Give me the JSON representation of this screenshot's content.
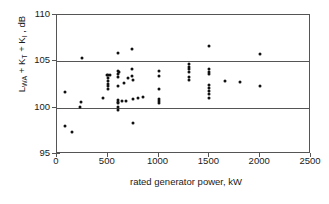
{
  "chart_data": {
    "type": "scatter",
    "title": "",
    "xlabel": "rated generator power, kW",
    "ylabel": "L_WA + K_T + K_I , dB",
    "ylabel_parts": {
      "base1": "L",
      "sub1": "WA",
      "plus1": " + ",
      "base2": "K",
      "sub2": "T",
      "plus2": " + ",
      "base3": "K",
      "sub3": "I",
      "tail": " , dB"
    },
    "xlim": [
      0,
      2500
    ],
    "ylim": [
      95,
      110
    ],
    "xticks": [
      0,
      500,
      1000,
      1500,
      2000,
      2500
    ],
    "yticks": [
      95,
      100,
      105,
      110
    ],
    "xtick_labels": [
      "0",
      "500",
      "1000",
      "1500",
      "2000",
      "2500"
    ],
    "ytick_labels": [
      "95",
      "100",
      "105",
      "110"
    ],
    "gridlines_y": [
      100,
      105
    ],
    "grid": "horizontal-only-at-100-and-105",
    "legend": "none",
    "marker": {
      "shape": "circle",
      "color": "#111111",
      "size_px": 3
    },
    "series": [
      {
        "name": "wind turbines",
        "points": [
          [
            80,
            101.7
          ],
          [
            80,
            98.0
          ],
          [
            150,
            97.4
          ],
          [
            230,
            100.1
          ],
          [
            235,
            100.6
          ],
          [
            250,
            105.35
          ],
          [
            450,
            101.0
          ],
          [
            490,
            103.5
          ],
          [
            500,
            103.5
          ],
          [
            500,
            103.2
          ],
          [
            500,
            102.9
          ],
          [
            500,
            102.6
          ],
          [
            500,
            102.3
          ],
          [
            500,
            102.0
          ],
          [
            520,
            103.5
          ],
          [
            600,
            105.9
          ],
          [
            600,
            104.0
          ],
          [
            600,
            103.6
          ],
          [
            600,
            103.3
          ],
          [
            600,
            102.3
          ],
          [
            600,
            100.8
          ],
          [
            600,
            100.6
          ],
          [
            600,
            100.5
          ],
          [
            600,
            100.1
          ],
          [
            600,
            99.8
          ],
          [
            610,
            103.9
          ],
          [
            640,
            100.7
          ],
          [
            660,
            102.7
          ],
          [
            680,
            100.7
          ],
          [
            700,
            103.2
          ],
          [
            740,
            106.3
          ],
          [
            740,
            104.2
          ],
          [
            740,
            103.4
          ],
          [
            750,
            103.0
          ],
          [
            750,
            100.9
          ],
          [
            750,
            98.3
          ],
          [
            800,
            101.0
          ],
          [
            850,
            101.2
          ],
          [
            1000,
            104.0
          ],
          [
            1000,
            103.4
          ],
          [
            1000,
            102.0
          ],
          [
            1000,
            100.9
          ],
          [
            1000,
            100.7
          ],
          [
            1000,
            100.5
          ],
          [
            1300,
            104.7
          ],
          [
            1300,
            104.4
          ],
          [
            1300,
            104.2
          ],
          [
            1300,
            103.9
          ],
          [
            1300,
            103.3
          ],
          [
            1300,
            103.0
          ],
          [
            1500,
            106.7
          ],
          [
            1500,
            104.2
          ],
          [
            1500,
            103.9
          ],
          [
            1500,
            103.6
          ],
          [
            1500,
            102.4
          ],
          [
            1500,
            102.1
          ],
          [
            1500,
            101.8
          ],
          [
            1500,
            101.5
          ],
          [
            1500,
            101.0
          ],
          [
            1650,
            102.9
          ],
          [
            1800,
            102.8
          ],
          [
            2000,
            105.8
          ],
          [
            2000,
            102.3
          ]
        ]
      }
    ]
  }
}
